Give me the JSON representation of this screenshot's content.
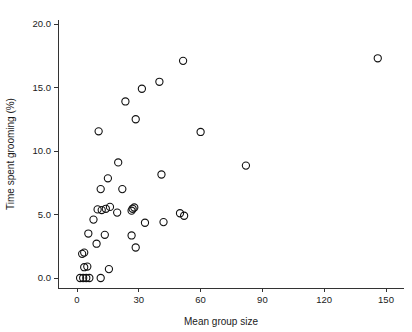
{
  "chart_data": {
    "type": "scatter",
    "title": "",
    "xlabel": "Mean group size",
    "ylabel": "Time spent grooming (%)",
    "xlim": [
      -4,
      158
    ],
    "ylim": [
      -1.2,
      21.0
    ],
    "xticks": [
      0,
      30,
      60,
      90,
      120,
      150
    ],
    "xticklabels": [
      "0",
      "30",
      "60",
      "90",
      "120",
      "150"
    ],
    "yticks": [
      0.0,
      5.0,
      10.0,
      15.0,
      20.0
    ],
    "yticklabels": [
      "0.0",
      "5.0",
      "10.0",
      "15.0",
      "20.0"
    ],
    "grid": false,
    "legend": null,
    "marker": "open-circle",
    "marker_color": "#111111",
    "points": [
      {
        "x": 1.5,
        "y": 0.0
      },
      {
        "x": 3.0,
        "y": 0.0
      },
      {
        "x": 4.5,
        "y": 0.0
      },
      {
        "x": 6.0,
        "y": 0.0
      },
      {
        "x": 11.5,
        "y": 0.0
      },
      {
        "x": 3.5,
        "y": 0.85
      },
      {
        "x": 5.0,
        "y": 0.9
      },
      {
        "x": 15.5,
        "y": 0.7
      },
      {
        "x": 2.5,
        "y": 1.9
      },
      {
        "x": 3.5,
        "y": 2.0
      },
      {
        "x": 9.5,
        "y": 2.7
      },
      {
        "x": 28.5,
        "y": 2.4
      },
      {
        "x": 5.5,
        "y": 3.5
      },
      {
        "x": 13.5,
        "y": 3.4
      },
      {
        "x": 26.5,
        "y": 3.35
      },
      {
        "x": 8.0,
        "y": 4.6
      },
      {
        "x": 33.0,
        "y": 4.35
      },
      {
        "x": 42.0,
        "y": 4.4
      },
      {
        "x": 10.0,
        "y": 5.4
      },
      {
        "x": 12.0,
        "y": 5.35
      },
      {
        "x": 14.0,
        "y": 5.45
      },
      {
        "x": 16.0,
        "y": 5.6
      },
      {
        "x": 19.5,
        "y": 5.15
      },
      {
        "x": 26.5,
        "y": 5.3
      },
      {
        "x": 27.0,
        "y": 5.45
      },
      {
        "x": 27.8,
        "y": 5.55
      },
      {
        "x": 50.0,
        "y": 5.1
      },
      {
        "x": 52.0,
        "y": 4.9
      },
      {
        "x": 11.5,
        "y": 7.0
      },
      {
        "x": 22.0,
        "y": 7.0
      },
      {
        "x": 15.0,
        "y": 7.85
      },
      {
        "x": 41.0,
        "y": 8.15
      },
      {
        "x": 82.0,
        "y": 8.85
      },
      {
        "x": 20.0,
        "y": 9.1
      },
      {
        "x": 10.5,
        "y": 11.55
      },
      {
        "x": 60.0,
        "y": 11.5
      },
      {
        "x": 28.5,
        "y": 12.5
      },
      {
        "x": 23.5,
        "y": 13.9
      },
      {
        "x": 31.5,
        "y": 14.9
      },
      {
        "x": 40.0,
        "y": 15.45
      },
      {
        "x": 51.5,
        "y": 17.1
      },
      {
        "x": 146.0,
        "y": 17.3
      }
    ]
  },
  "axes": {
    "x_axis_label": "Mean group size",
    "y_axis_label": "Time spent grooming (%)"
  }
}
